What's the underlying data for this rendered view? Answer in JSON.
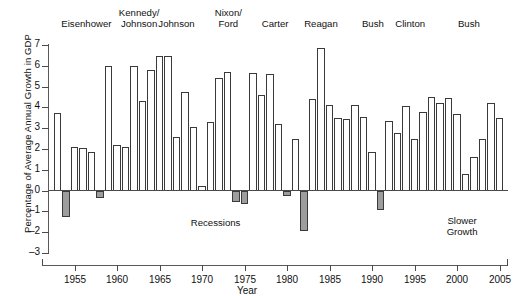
{
  "chart_data": {
    "type": "bar",
    "title": "",
    "xlabel": "Year",
    "ylabel": "Percentage of Average Annual Growth in GDP",
    "ylim": [
      -3,
      7
    ],
    "xlim": [
      1952,
      2006
    ],
    "ytick_labels": [
      "7",
      "6",
      "5",
      "4",
      "3",
      "2",
      "1",
      "0",
      "-1",
      "-2",
      "-3"
    ],
    "ytick_values": [
      7,
      6,
      5,
      4,
      3,
      2,
      1,
      0,
      -1,
      -2,
      -3
    ],
    "xtick_labels": [
      "1955",
      "1960",
      "1965",
      "1970",
      "1975",
      "1980",
      "1985",
      "1990",
      "1995",
      "2000",
      "2005"
    ],
    "xtick_values": [
      1955,
      1960,
      1965,
      1970,
      1975,
      1980,
      1985,
      1990,
      1995,
      2000,
      2005
    ],
    "grid": false,
    "legend": "none",
    "categories": [
      1953,
      1954,
      1955,
      1956,
      1957,
      1958,
      1959,
      1960,
      1961,
      1962,
      1963,
      1964,
      1965,
      1966,
      1967,
      1968,
      1969,
      1970,
      1971,
      1972,
      1973,
      1974,
      1975,
      1976,
      1977,
      1978,
      1979,
      1980,
      1981,
      1982,
      1983,
      1984,
      1985,
      1986,
      1987,
      1988,
      1989,
      1990,
      1991,
      1992,
      1993,
      1994,
      1995,
      1996,
      1997,
      1998,
      1999,
      2000,
      2001,
      2002,
      2003,
      2004,
      2005
    ],
    "values": [
      3.75,
      -1.25,
      2.1,
      2.05,
      1.85,
      -0.35,
      6.0,
      2.2,
      2.1,
      6.0,
      4.3,
      5.8,
      6.45,
      6.45,
      2.6,
      4.75,
      3.05,
      0.2,
      3.3,
      5.4,
      5.7,
      -0.55,
      -0.65,
      5.65,
      4.6,
      5.6,
      3.2,
      -0.25,
      2.5,
      -1.95,
      4.4,
      6.85,
      4.1,
      3.5,
      3.45,
      4.1,
      3.55,
      1.85,
      -0.95,
      3.35,
      2.75,
      4.05,
      2.5,
      3.8,
      4.5,
      4.2,
      4.45,
      3.7,
      0.8,
      1.6,
      2.5,
      4.2,
      3.5
    ],
    "series_name": "Average annual growth in GDP",
    "bar_styles": {
      "positive": {
        "fill": "#ffffff",
        "stroke": "#3a3a3a",
        "label": "growth"
      },
      "negative": {
        "fill": "#9d9d9d",
        "stroke": "#3a3a3a",
        "label": "recession"
      }
    },
    "annotations": [
      {
        "id": "recessions",
        "text": "Recessions",
        "x": 1971.6,
        "y": -1.55
      },
      {
        "id": "slower-growth",
        "text": "Slower\nGrowth",
        "x": 2000.6,
        "y": -1.45
      }
    ],
    "presidents": [
      {
        "id": "eisenhower",
        "label": "Eisenhower",
        "center_year": 1956.4
      },
      {
        "id": "kennedy-johnson",
        "label": "Kennedy/\nJohnson",
        "center_year": 1962.6
      },
      {
        "id": "johnson",
        "label": "Johnson",
        "center_year": 1967.0
      },
      {
        "id": "nixon-ford",
        "label": "Nixon/\nFord",
        "center_year": 1973.1
      },
      {
        "id": "carter",
        "label": "Carter",
        "center_year": 1978.6
      },
      {
        "id": "reagan",
        "label": "Reagan",
        "center_year": 1984.0
      },
      {
        "id": "bush-sr",
        "label": "Bush",
        "center_year": 1990.1
      },
      {
        "id": "clinton",
        "label": "Clinton",
        "center_year": 1994.5
      },
      {
        "id": "bush-jr",
        "label": "Bush",
        "center_year": 2001.4
      }
    ]
  }
}
